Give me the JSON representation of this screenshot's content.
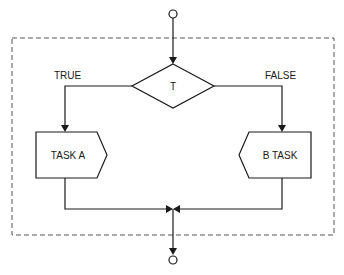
{
  "diagram": {
    "type": "flowchart",
    "title": "",
    "decision": {
      "label": "T"
    },
    "branches": [
      {
        "label": "TRUE",
        "task": "TASK A",
        "side": "left"
      },
      {
        "label": "FALSE",
        "task": "B TASK",
        "side": "right"
      }
    ],
    "start_terminal": "circle",
    "end_terminal": "circle",
    "merge": "junction",
    "colors": {
      "stroke": "#1a1a1a",
      "dashed_box": "#555555",
      "background": "#ffffff"
    }
  }
}
